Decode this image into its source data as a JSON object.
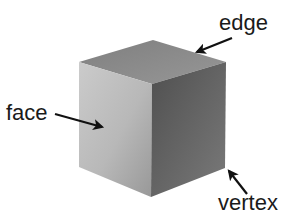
{
  "diagram": {
    "labels": {
      "edge": "edge",
      "face": "face",
      "vertex": "vertex"
    },
    "colors": {
      "background": "#ffffff",
      "top_face": "#8e8e8e",
      "left_face_light": "#c4c4c4",
      "left_face_dark": "#9e9e9e",
      "right_face_light": "#5e5e5e",
      "right_face_dark": "#7a7a7a",
      "text": "#1a1a1a",
      "arrow": "#111111"
    }
  }
}
